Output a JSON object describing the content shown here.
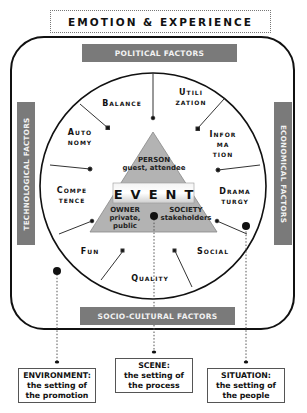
{
  "title": "EMOTION & EXPERIENCE",
  "factor_bars": {
    "top": "POLITICAL FACTORS",
    "left": "TECHNOLOGICAL FACTORS",
    "right": "ECONOMICAL FACTORS",
    "bottom": "SOCIO-CULTURAL FACTORS"
  },
  "circle_factors": [
    {
      "id": "balance",
      "lines": [
        "Balance"
      ]
    },
    {
      "id": "utilization",
      "lines": [
        "Utili",
        "zation"
      ]
    },
    {
      "id": "autonomy",
      "lines": [
        "Auto",
        "nomy"
      ]
    },
    {
      "id": "information",
      "lines": [
        "Infor",
        "ma",
        "tion"
      ]
    },
    {
      "id": "competence",
      "lines": [
        "Compe",
        "tence"
      ]
    },
    {
      "id": "dramaturgy",
      "lines": [
        "Drama",
        "turgy"
      ]
    },
    {
      "id": "fun",
      "lines": [
        "Fun"
      ]
    },
    {
      "id": "social",
      "lines": [
        "Social"
      ]
    },
    {
      "id": "quality",
      "lines": [
        "Quality"
      ]
    }
  ],
  "triangle": {
    "center": "EVENT",
    "top": {
      "title": "PERSON",
      "sub": "guest, attendee"
    },
    "bottom_left": {
      "title": "OWNER",
      "sub": "private, public"
    },
    "bottom_right": {
      "title": "SOCIETY",
      "sub": "stakeholders"
    }
  },
  "settings": [
    {
      "id": "environment",
      "title": "ENVIRONMENT:",
      "line1": "the setting of",
      "line2": "the promotion"
    },
    {
      "id": "scene",
      "title": "SCENE:",
      "line1": "the setting of",
      "line2": "the process"
    },
    {
      "id": "situation",
      "title": "SITUATION:",
      "line1": "the setting of",
      "line2": "the people"
    }
  ]
}
